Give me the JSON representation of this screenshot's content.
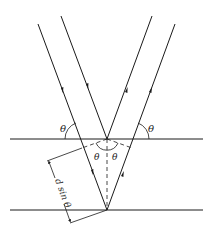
{
  "diagram": {
    "type": "bragg-reflection",
    "labels": {
      "theta_top_left": "θ",
      "theta_top_right": "θ",
      "theta_inner_left": "θ",
      "theta_inner_right": "θ",
      "path_difference": "d sin θ"
    },
    "colors": {
      "line": "#1a1a1a",
      "background": "#ffffff"
    }
  }
}
